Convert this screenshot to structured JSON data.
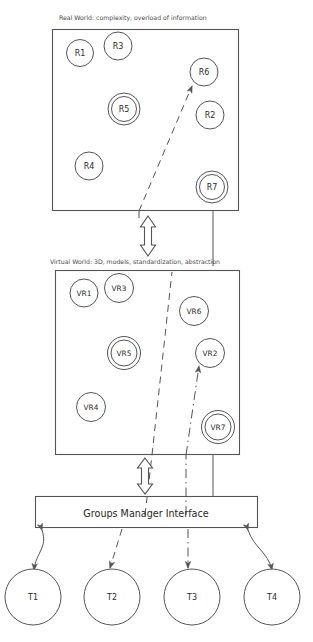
{
  "figure": {
    "title_real": "Real World: complexity, overload of information",
    "title_virtual": "Virtual World: 3D, models, standardization, abstraction",
    "interface_label": "Groups Manager Interface",
    "stroke_color": "#555555",
    "text_color": "#2b2b2b",
    "caption_color": "#4a4a4a",
    "background": "#ffffff"
  },
  "real_world": {
    "nodes": [
      {
        "id": "R1",
        "label": "R1",
        "double": false
      },
      {
        "id": "R3",
        "label": "R3",
        "double": false
      },
      {
        "id": "R6",
        "label": "R6",
        "double": false
      },
      {
        "id": "R5",
        "label": "R5",
        "double": true
      },
      {
        "id": "R2",
        "label": "R2",
        "double": false
      },
      {
        "id": "R4",
        "label": "R4",
        "double": false
      },
      {
        "id": "R7",
        "label": "R7",
        "double": true
      }
    ]
  },
  "virtual_world": {
    "nodes": [
      {
        "id": "VR1",
        "label": "VR1",
        "double": false
      },
      {
        "id": "VR3",
        "label": "VR3",
        "double": false
      },
      {
        "id": "VR6",
        "label": "VR6",
        "double": false
      },
      {
        "id": "VR5",
        "label": "VR5",
        "double": true
      },
      {
        "id": "VR2",
        "label": "VR2",
        "double": false
      },
      {
        "id": "VR4",
        "label": "VR4",
        "double": false
      },
      {
        "id": "VR7",
        "label": "VR7",
        "double": true
      }
    ]
  },
  "terminals": {
    "nodes": [
      {
        "id": "T1",
        "label": "T1"
      },
      {
        "id": "T2",
        "label": "T2"
      },
      {
        "id": "T3",
        "label": "T3"
      },
      {
        "id": "T4",
        "label": "T4"
      }
    ]
  },
  "connectors": {
    "real_virtual_arrow": "double-headed-vertical-block-arrow",
    "virtual_interface_arrow": "double-headed-vertical-block-arrow",
    "t1_link": "solid-curved-double-arrow",
    "t2_link": "dashed-arrow",
    "t3_link": "dash-dot-arrow",
    "t4_link": "solid-curved-double-arrow"
  }
}
